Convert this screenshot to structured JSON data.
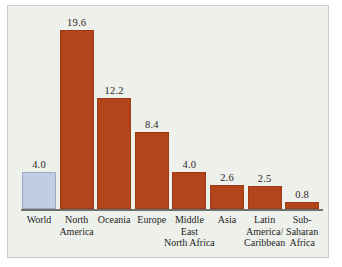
{
  "chart_data": {
    "type": "bar",
    "title": "",
    "subtitle": "",
    "xlabel": "",
    "ylabel": "",
    "ylim": [
      0,
      21
    ],
    "grid": false,
    "legend": "none",
    "axis": {
      "baseline_shown": true,
      "y_axis_shown": false,
      "tick_labels": []
    },
    "value_label_format": "one decimal",
    "categories": [
      "World",
      "North America",
      "Oceania",
      "Europe",
      "Middle East North Africa",
      "Asia",
      "Latin America/ Caribbean",
      "Sub- Saharan Africa"
    ],
    "category_label_lines": [
      [
        "World"
      ],
      [
        "North",
        "America"
      ],
      [
        "Oceania"
      ],
      [
        "Europe"
      ],
      [
        "Middle",
        "East",
        "North Africa"
      ],
      [
        "Asia"
      ],
      [
        "Latin",
        "America/",
        "Caribbean"
      ],
      [
        "Sub-",
        "Saharan",
        "Africa"
      ]
    ],
    "values": [
      4.0,
      19.6,
      12.2,
      8.4,
      4.0,
      2.6,
      2.5,
      0.8
    ],
    "value_labels": [
      "4.0",
      "19.6",
      "12.2",
      "8.4",
      "4.0",
      "2.6",
      "2.5",
      "0.8"
    ],
    "bar_colors": [
      "#c2cce4",
      "#b4441a",
      "#b4441a",
      "#b4441a",
      "#b4441a",
      "#b4441a",
      "#b4441a",
      "#b4441a"
    ],
    "bar_border_colors": [
      "#9aa6c4",
      "#9b3a14",
      "#9b3a14",
      "#9b3a14",
      "#9b3a14",
      "#9b3a14",
      "#9b3a14",
      "#9b3a14"
    ]
  },
  "colors": {
    "highlight_bar": "#c2cce4",
    "series_bar": "#b4441a",
    "panel_background": "#eef0ec",
    "panel_border": "#c9cdc6",
    "axis_line": "#6d6f6b",
    "text": "#241f1c"
  }
}
